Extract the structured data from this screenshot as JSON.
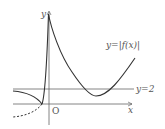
{
  "diagram": {
    "axes": {
      "x_label": "x",
      "y_label": "y",
      "origin_label": "O"
    },
    "curves": {
      "main_label": "y=|f(x)|",
      "asymptote_label": "y=2"
    },
    "colors": {
      "curve": "#333333",
      "axis": "#555555",
      "line": "#666666",
      "background": "#ffffff"
    }
  }
}
